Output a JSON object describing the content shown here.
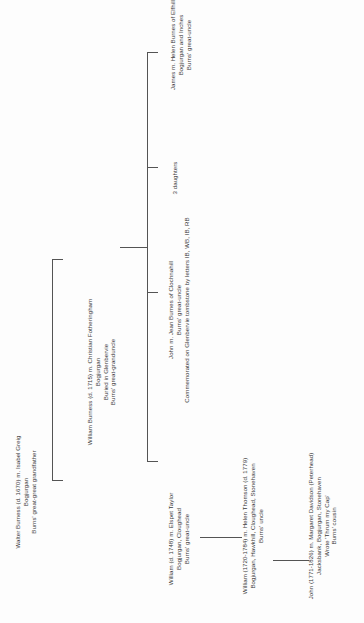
{
  "diagram": {
    "orientation": "rotated-90-left",
    "line_color": "#545454",
    "text_color": "#3a3a3a",
    "background": "#fdfdfd"
  },
  "nodes": {
    "walter": {
      "id": "walter-burness",
      "lines": [
        "Walter Burness (d. 1670) m. Isabel Greig",
        "Bogjurgan",
        "Burns' great-great grandfather"
      ]
    },
    "william_1715": {
      "id": "william-burness-1715",
      "lines": [
        "William Burness (d. 1715) m. Christian Fotheringham",
        "Bogjurgan",
        "Buried in Glenbervie",
        "Burns' great-granduncle"
      ]
    },
    "james": {
      "id": "james-burnes",
      "lines": [
        "James m. Helen Burnes of Elfhill",
        "Bogjurgan and Inches",
        "Burns' great-uncle"
      ]
    },
    "daughters": {
      "id": "three-daughters",
      "lines": [
        "3 daughters"
      ]
    },
    "john_clochnahill": {
      "id": "john-burnes-clochnahill",
      "lines": [
        "John m. Jean Burnes of Clochnahill",
        "Burns' great-uncle",
        "Commemorated on Glenbervie tombstone by letters IB, WB, IB, RB"
      ]
    },
    "william_1748": {
      "id": "william-1748",
      "lines": [
        "William (d. 1748) m. Elspet Taylor",
        "Bogjurgan, Cloughead",
        "Burns' great-uncle"
      ]
    },
    "william_1720": {
      "id": "william-1720-1784",
      "lines": [
        "William (1720-1784) m. Helen Thomson (d. 1779)",
        "Bogjurgan, Hawkhill, Cloughead, Stonehaven",
        "Burns' uncle"
      ]
    },
    "john_1771": {
      "id": "john-1771-1826",
      "lines": [
        "John (1771-1826) m. Margaret Davidson (Peterhead)",
        "Jacksbank, Bogjurgan, Stonehaven",
        "Wrote 'Thrum my Cap'",
        "Burns' cousin"
      ]
    }
  }
}
